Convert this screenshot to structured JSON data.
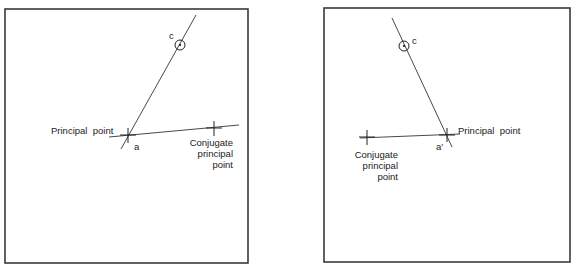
{
  "left_panel": {
    "labels": {
      "c": "c",
      "a": "a",
      "principal_point": "Principal  point",
      "conjugate_line1": "Conjugate",
      "conjugate_line2": "principal",
      "conjugate_line3": "point"
    }
  },
  "right_panel": {
    "labels": {
      "c": "c",
      "a_prime": "a′",
      "principal_point": "Principal  point",
      "conjugate_line1": "Conjugate",
      "conjugate_line2": "principal",
      "conjugate_line3": "point"
    }
  },
  "colors": {
    "line": "#333333",
    "frame": "#3a3a3a",
    "background": "#ffffff"
  }
}
